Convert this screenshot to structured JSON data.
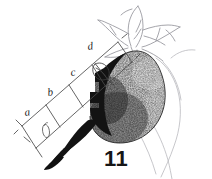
{
  "figure": {
    "number_label": "11",
    "background_color": "#ffffff",
    "ink_color": "#1c1c1c",
    "faint_ink_color": "#9a9aa0",
    "stipple_color": "#2a2a2a",
    "width": 212,
    "height": 179,
    "caption_position": "bottom-center-right",
    "illustration_type": "stippled-line-engraving"
  },
  "scale": {
    "orientation": "diagonal-lower-left-to-upper-right",
    "segment_labels": [
      {
        "id": "a",
        "label": "a",
        "order": 1
      },
      {
        "id": "b",
        "label": "b",
        "order": 2
      },
      {
        "id": "c",
        "label": "c",
        "order": 3
      },
      {
        "id": "d",
        "label": "d",
        "order": 4
      }
    ],
    "rail_count": 2,
    "rung_count": 5
  },
  "parts": {
    "body_name": "stippled-body",
    "beak_name": "dark-beak-tip",
    "calyx_name": "calyx-leaves",
    "pointer_name": "leaf-pointer-mark",
    "loop_name": "small-loop-mark",
    "outline_name": "faint-background-outline"
  }
}
